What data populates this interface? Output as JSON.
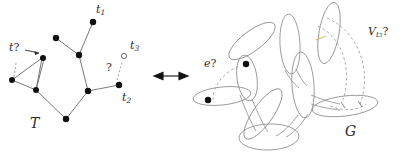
{
  "figure": {
    "colors": {
      "ink": "#2b2b2b",
      "node_fill": "#111111",
      "open_node_fill": "#ffffff",
      "edge": "#6a6a6a",
      "bag_outline": "#8d8d8d",
      "dashed": "#9a9a9a",
      "highlight": "#c9b23a"
    }
  },
  "left_panel": {
    "name": "tree-T",
    "label": "T",
    "node_labels": {
      "t1": "t",
      "t1_sub": "1",
      "t2": "t",
      "t2_sub": "2",
      "t3": "t",
      "t3_sub": "3"
    },
    "annotations": {
      "t_query": "t",
      "t_query_mark": "?",
      "question": "?"
    }
  },
  "center": {
    "name": "bidirectional-arrow",
    "glyph": "left-right-arrow"
  },
  "right_panel": {
    "name": "graph-G",
    "label": "G",
    "annotations": {
      "e_query": "e",
      "e_query_mark": "?",
      "vt3": "V",
      "vt3_sub": "t",
      "vt3_sub_sub": "3",
      "vt3_mark": "?"
    }
  }
}
